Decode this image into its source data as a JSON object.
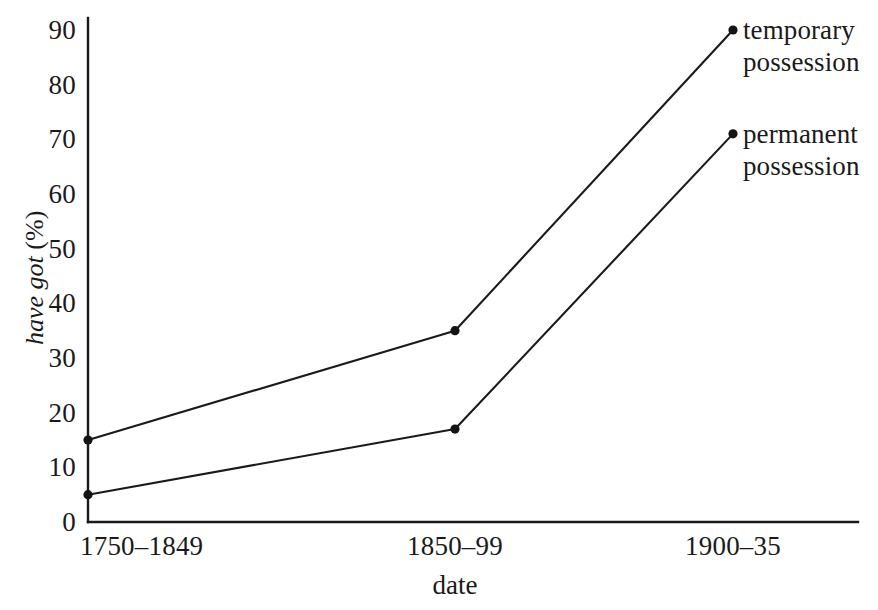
{
  "chart_data": {
    "type": "line",
    "title": "",
    "subtitle": "",
    "xlabel": "date",
    "ylabel": "have got (%)",
    "ylabel_name": "have got",
    "ylabel_unit": "(%)",
    "categories": [
      "1750–1849",
      "1850–99",
      "1900–35"
    ],
    "x": [
      0,
      1,
      2
    ],
    "series": [
      {
        "name": "temporary possession",
        "label_line1": "temporary",
        "label_line2": "possession",
        "values": [
          15,
          35,
          90
        ]
      },
      {
        "name": "permanent possession",
        "label_line1": "permanent",
        "label_line2": "possession",
        "values": [
          5,
          17,
          71
        ]
      }
    ],
    "ylim": [
      0,
      90
    ],
    "yticks": [
      0,
      10,
      20,
      30,
      40,
      50,
      60,
      70,
      80,
      90
    ],
    "ytick_labels": [
      "0",
      "10",
      "20",
      "30",
      "40",
      "50",
      "60",
      "70",
      "80",
      "90"
    ],
    "grid": false,
    "legend": "inline-endpoint-labels",
    "legend_position": "right-of-endpoints",
    "markers": "filled-circle",
    "line_color": "#1a1a1a",
    "background_color": "#ffffff",
    "axis_color": "#1a1a1a"
  },
  "geometry": {
    "x_positions": [
      88,
      455,
      733
    ],
    "y_zero_px": 522,
    "y_max_px": 30,
    "axis_x_px": 88,
    "axis_right_px": 858,
    "marker_radius": 4.6
  },
  "labels": {
    "x_axis_title_x": 455,
    "x_axis_title_y": 572,
    "y_axis_title_x": 22,
    "y_axis_title_y": 345
  }
}
